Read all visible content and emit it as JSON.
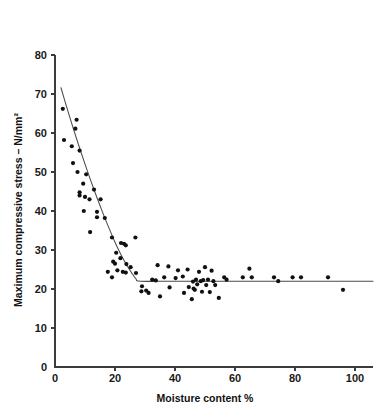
{
  "chart_data": {
    "type": "scatter",
    "title": "",
    "xlabel": "Moisture content %",
    "ylabel": "Maximum compressive stress – N/mm²",
    "xlim": [
      0,
      106
    ],
    "ylim": [
      0,
      80
    ],
    "xticks": [
      0,
      20,
      40,
      60,
      80,
      100
    ],
    "yticks": [
      0,
      10,
      20,
      30,
      40,
      50,
      60,
      70,
      80
    ],
    "xtick_labels": [
      "0",
      "20",
      "40",
      "60",
      "80",
      "100"
    ],
    "ytick_labels": [
      "0",
      "10",
      "20",
      "30",
      "40",
      "50",
      "60",
      "70",
      "80"
    ],
    "grid": false,
    "legend": false,
    "point_color": "#101010",
    "curve_color": "#4a4a4a",
    "axis_color": "#3b3b3b",
    "series": [
      {
        "name": "Measurements",
        "points": [
          [
            2.6,
            66.2
          ],
          [
            7.2,
            63.4
          ],
          [
            6.8,
            61.1
          ],
          [
            3.0,
            58.2
          ],
          [
            5.6,
            56.6
          ],
          [
            8.2,
            55.5
          ],
          [
            6.0,
            52.3
          ],
          [
            7.5,
            50.0
          ],
          [
            10.4,
            49.4
          ],
          [
            9.4,
            47.0
          ],
          [
            13.0,
            45.5
          ],
          [
            8.2,
            44.8
          ],
          [
            8.2,
            44.0
          ],
          [
            10.0,
            43.6
          ],
          [
            11.5,
            43.0
          ],
          [
            15.2,
            43.0
          ],
          [
            9.6,
            40.0
          ],
          [
            14.0,
            39.8
          ],
          [
            14.0,
            38.4
          ],
          [
            16.6,
            38.2
          ],
          [
            11.7,
            34.6
          ],
          [
            19.0,
            33.2
          ],
          [
            22.0,
            31.8
          ],
          [
            23.0,
            31.6
          ],
          [
            26.8,
            33.2
          ],
          [
            23.6,
            31.2
          ],
          [
            20.4,
            29.3
          ],
          [
            21.8,
            27.9
          ],
          [
            23.8,
            26.4
          ],
          [
            19.4,
            27.0
          ],
          [
            20.0,
            26.5
          ],
          [
            25.2,
            25.6
          ],
          [
            20.8,
            24.8
          ],
          [
            22.6,
            24.4
          ],
          [
            23.6,
            24.2
          ],
          [
            17.6,
            24.4
          ],
          [
            19.0,
            23.0
          ],
          [
            27.0,
            24.1
          ],
          [
            29.0,
            20.7
          ],
          [
            28.8,
            19.4
          ],
          [
            30.4,
            19.6
          ],
          [
            31.2,
            19.0
          ],
          [
            32.4,
            22.4
          ],
          [
            33.6,
            22.2
          ],
          [
            35.0,
            18.1
          ],
          [
            34.2,
            26.1
          ],
          [
            36.4,
            23.0
          ],
          [
            37.8,
            25.8
          ],
          [
            38.2,
            20.4
          ],
          [
            40.2,
            22.8
          ],
          [
            41.0,
            24.8
          ],
          [
            42.6,
            23.2
          ],
          [
            43.0,
            19.0
          ],
          [
            44.2,
            25.0
          ],
          [
            44.6,
            20.5
          ],
          [
            45.6,
            17.4
          ],
          [
            46.0,
            21.9
          ],
          [
            46.2,
            20.1
          ],
          [
            46.6,
            19.8
          ],
          [
            47.0,
            22.4
          ],
          [
            47.4,
            21.2
          ],
          [
            48.0,
            24.4
          ],
          [
            48.6,
            22.0
          ],
          [
            49.0,
            19.3
          ],
          [
            49.4,
            22.3
          ],
          [
            50.0,
            25.6
          ],
          [
            50.4,
            21.0
          ],
          [
            51.0,
            22.4
          ],
          [
            51.6,
            19.2
          ],
          [
            52.2,
            24.7
          ],
          [
            52.8,
            22.0
          ],
          [
            53.4,
            21.0
          ],
          [
            54.6,
            17.7
          ],
          [
            56.4,
            23.0
          ],
          [
            57.2,
            22.4
          ],
          [
            62.6,
            23.0
          ],
          [
            64.8,
            25.2
          ],
          [
            65.6,
            23.0
          ],
          [
            73.0,
            23.0
          ],
          [
            74.4,
            22.0
          ],
          [
            79.2,
            23.0
          ],
          [
            82.0,
            23.0
          ],
          [
            91.0,
            23.0
          ],
          [
            96.0,
            19.8
          ]
        ]
      }
    ],
    "fit_curve": {
      "name": "Fitted trend",
      "points": [
        [
          2.0,
          71.6
        ],
        [
          4.0,
          66.4
        ],
        [
          6.0,
          61.4
        ],
        [
          8.0,
          56.6
        ],
        [
          10.0,
          52.0
        ],
        [
          12.0,
          47.6
        ],
        [
          14.0,
          43.4
        ],
        [
          16.0,
          39.4
        ],
        [
          18.0,
          35.6
        ],
        [
          20.0,
          32.0
        ],
        [
          22.0,
          28.8
        ],
        [
          24.0,
          26.0
        ],
        [
          25.5,
          24.2
        ],
        [
          27.0,
          22.6
        ],
        [
          28.5,
          22.0
        ],
        [
          40.0,
          22.0
        ],
        [
          60.0,
          22.0
        ],
        [
          80.0,
          22.0
        ],
        [
          106.0,
          22.0
        ]
      ]
    }
  }
}
